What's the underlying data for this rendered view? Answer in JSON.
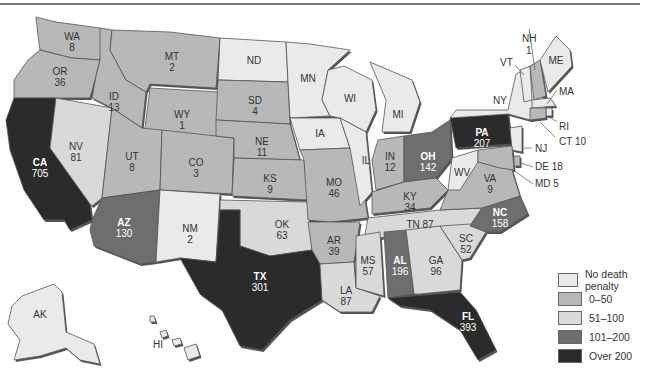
{
  "map": {
    "title": "",
    "type": "choropleth",
    "subject": "Death row / executions by state",
    "legend": [
      {
        "label": "No death penalty",
        "category": "none",
        "color": "#eaeaea"
      },
      {
        "label": "0–50",
        "category": "0-50",
        "color": "#b8b8b8"
      },
      {
        "label": "51–100",
        "category": "51-100",
        "color": "#d9d9d9"
      },
      {
        "label": "101–200",
        "category": "101-200",
        "color": "#6e6e6e"
      },
      {
        "label": "Over 200",
        "category": "over200",
        "color": "#2b2b2b"
      }
    ],
    "states": {
      "WA": {
        "label": "WA",
        "value": "8",
        "category": "0-50"
      },
      "OR": {
        "label": "OR",
        "value": "36",
        "category": "0-50"
      },
      "CA": {
        "label": "CA",
        "value": "705",
        "category": "over200"
      },
      "NV": {
        "label": "NV",
        "value": "81",
        "category": "51-100"
      },
      "ID": {
        "label": "ID",
        "value": "13",
        "category": "0-50"
      },
      "MT": {
        "label": "MT",
        "value": "2",
        "category": "0-50"
      },
      "WY": {
        "label": "WY",
        "value": "1",
        "category": "0-50"
      },
      "UT": {
        "label": "UT",
        "value": "8",
        "category": "0-50"
      },
      "CO": {
        "label": "CO",
        "value": "3",
        "category": "0-50"
      },
      "AZ": {
        "label": "AZ",
        "value": "130",
        "category": "101-200"
      },
      "NM": {
        "label": "NM",
        "value": "2",
        "category": "none"
      },
      "ND": {
        "label": "ND",
        "value": "",
        "category": "none"
      },
      "SD": {
        "label": "SD",
        "value": "4",
        "category": "0-50"
      },
      "NE": {
        "label": "NE",
        "value": "11",
        "category": "0-50"
      },
      "KS": {
        "label": "KS",
        "value": "9",
        "category": "0-50"
      },
      "OK": {
        "label": "OK",
        "value": "63",
        "category": "51-100"
      },
      "TX": {
        "label": "TX",
        "value": "301",
        "category": "over200"
      },
      "MN": {
        "label": "MN",
        "value": "",
        "category": "none"
      },
      "IA": {
        "label": "IA",
        "value": "",
        "category": "none"
      },
      "MO": {
        "label": "MO",
        "value": "46",
        "category": "0-50"
      },
      "AR": {
        "label": "AR",
        "value": "39",
        "category": "0-50"
      },
      "LA": {
        "label": "LA",
        "value": "87",
        "category": "51-100"
      },
      "WI": {
        "label": "WI",
        "value": "",
        "category": "none"
      },
      "IL": {
        "label": "IL",
        "value": "",
        "category": "none"
      },
      "MI": {
        "label": "MI",
        "value": "",
        "category": "none"
      },
      "IN": {
        "label": "IN",
        "value": "12",
        "category": "0-50"
      },
      "OH": {
        "label": "OH",
        "value": "142",
        "category": "101-200"
      },
      "KY": {
        "label": "KY",
        "value": "34",
        "category": "0-50"
      },
      "TN": {
        "label": "TN",
        "value": "87",
        "category": "51-100"
      },
      "MS": {
        "label": "MS",
        "value": "57",
        "category": "51-100"
      },
      "AL": {
        "label": "AL",
        "value": "196",
        "category": "101-200"
      },
      "GA": {
        "label": "GA",
        "value": "96",
        "category": "51-100"
      },
      "FL": {
        "label": "FL",
        "value": "393",
        "category": "over200"
      },
      "SC": {
        "label": "SC",
        "value": "52",
        "category": "51-100"
      },
      "NC": {
        "label": "NC",
        "value": "158",
        "category": "101-200"
      },
      "VA": {
        "label": "VA",
        "value": "9",
        "category": "0-50"
      },
      "WV": {
        "label": "WV",
        "value": "",
        "category": "none"
      },
      "PA": {
        "label": "PA",
        "value": "207",
        "category": "over200"
      },
      "NY": {
        "label": "NY",
        "value": "",
        "category": "none"
      },
      "VT": {
        "label": "VT",
        "value": "",
        "category": "none"
      },
      "NH": {
        "label": "NH",
        "value": "1",
        "category": "0-50"
      },
      "ME": {
        "label": "ME",
        "value": "",
        "category": "none"
      },
      "MA": {
        "label": "MA",
        "value": "",
        "category": "none"
      },
      "RI": {
        "label": "RI",
        "value": "",
        "category": "none"
      },
      "CT": {
        "label": "CT",
        "value": "10",
        "category": "0-50"
      },
      "NJ": {
        "label": "NJ",
        "value": "",
        "category": "none"
      },
      "DE": {
        "label": "DE",
        "value": "18",
        "category": "0-50"
      },
      "MD": {
        "label": "MD",
        "value": "5",
        "category": "0-50"
      },
      "AK": {
        "label": "AK",
        "value": "",
        "category": "none"
      },
      "HI": {
        "label": "HI",
        "value": "",
        "category": "none"
      }
    },
    "external_labels": {
      "NH": "NH",
      "NH_val": "1",
      "VT": "VT",
      "ME": "ME",
      "MA": "MA",
      "RI": "RI",
      "CT": "CT 10",
      "NJ": "NJ",
      "DE": "DE 18",
      "MD": "MD 5",
      "TN": "TN 87"
    }
  }
}
